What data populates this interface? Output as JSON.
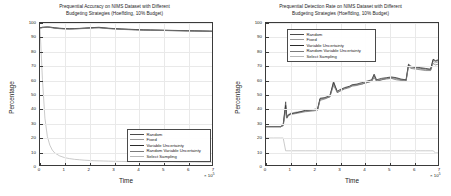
{
  "figure": {
    "width": 451,
    "height": 196,
    "background": "#ffffff"
  },
  "series_colors": {
    "random": "#4a4a4a",
    "fixed": "#9a9a9a",
    "variable_uncertainty": "#2b2b2b",
    "random_variable_uncertainty": "#7a7a7a",
    "select_sampling": "#b8b8b8"
  },
  "legend_labels": {
    "random": "Random",
    "fixed": "Fixed",
    "variable_uncertainty": "Variable Uncertainty",
    "random_variable_uncertainty": "Random Variable Uncertainty",
    "select_sampling": "Select Sampling"
  },
  "axis_common": {
    "xlabel": "Time",
    "ylabel": "Percentage",
    "x_exponent_prefix": "× 10",
    "x_exponent": "5",
    "xticks": [
      "0",
      "1",
      "2",
      "3",
      "4",
      "5",
      "6",
      "7"
    ],
    "yticks": [
      "0",
      "10",
      "20",
      "30",
      "40",
      "50",
      "60",
      "70",
      "80",
      "90",
      "100"
    ]
  },
  "chart_data": [
    {
      "panel": "left",
      "type": "line",
      "title": "Prequential Accuracy on NIMS Dataset with Different\nBudgeting Strategies (Hoeffding, 10% Budget)",
      "xlabel": "Time",
      "ylabel": "Percentage",
      "xlim": [
        0,
        7
      ],
      "ylim": [
        0,
        100
      ],
      "x_multiplier": 100000,
      "grid": true,
      "legend_position": "lower-right",
      "legend": [
        "Random",
        "Fixed",
        "Variable Uncertainty",
        "Random Variable Uncertainty",
        "Select Sampling"
      ],
      "x": [
        0,
        0.1,
        0.2,
        0.3,
        0.4,
        0.5,
        0.6,
        0.8,
        1.0,
        1.2,
        1.4,
        1.6,
        1.8,
        2.0,
        2.2,
        2.4,
        2.6,
        2.8,
        3.0,
        3.3,
        3.6,
        3.9,
        4.2,
        4.5,
        4.8,
        5.1,
        5.4,
        5.7,
        6.0,
        6.3,
        6.6,
        6.9,
        7.1
      ],
      "series": [
        {
          "name": "Random",
          "values": [
            96.5,
            96.9,
            97.0,
            97.1,
            97.0,
            96.8,
            96.5,
            96.2,
            96.0,
            95.9,
            96.0,
            96.1,
            96.3,
            96.5,
            96.7,
            96.8,
            96.5,
            96.2,
            96.0,
            95.7,
            95.5,
            95.3,
            95.1,
            95.0,
            94.9,
            94.8,
            94.7,
            94.6,
            94.5,
            94.4,
            94.3,
            94.2,
            94.1
          ]
        },
        {
          "name": "Fixed",
          "values": [
            96.4,
            96.8,
            96.9,
            97.0,
            96.9,
            96.7,
            96.4,
            96.1,
            95.9,
            95.8,
            95.9,
            96.0,
            96.2,
            96.4,
            96.6,
            96.7,
            96.4,
            96.1,
            95.9,
            95.6,
            95.4,
            95.2,
            95.0,
            94.9,
            94.8,
            94.7,
            94.6,
            94.5,
            94.4,
            94.3,
            94.2,
            94.1,
            94.0
          ]
        },
        {
          "name": "Variable Uncertainty",
          "values": [
            96.6,
            97.0,
            97.1,
            97.2,
            97.1,
            96.9,
            96.6,
            96.3,
            96.1,
            96.0,
            96.1,
            96.2,
            96.4,
            96.6,
            96.8,
            97.0,
            96.6,
            96.3,
            96.1,
            95.8,
            95.6,
            95.4,
            95.2,
            95.1,
            95.0,
            94.9,
            94.8,
            94.7,
            94.6,
            94.5,
            94.4,
            94.3,
            94.2
          ]
        },
        {
          "name": "Random Variable Uncertainty",
          "values": [
            96.3,
            96.7,
            96.9,
            97.0,
            96.9,
            96.6,
            96.3,
            96.0,
            95.8,
            95.7,
            95.8,
            96.0,
            96.1,
            96.3,
            96.5,
            96.6,
            96.3,
            96.0,
            95.8,
            95.5,
            95.3,
            95.1,
            95.0,
            94.9,
            94.8,
            94.7,
            94.6,
            94.5,
            94.4,
            94.3,
            94.2,
            94.1,
            94.0
          ]
        },
        {
          "name": "Select Sampling",
          "values": [
            96.5,
            60.0,
            33.0,
            20.0,
            14.0,
            10.5,
            8.5,
            6.4,
            5.2,
            4.5,
            4.0,
            3.7,
            3.4,
            3.2,
            3.0,
            2.9,
            2.8,
            2.7,
            2.6,
            2.5,
            2.4,
            2.4,
            2.3,
            2.3,
            2.2,
            2.2,
            2.2,
            2.1,
            2.1,
            2.1,
            2.0,
            2.0,
            2.0
          ]
        }
      ]
    },
    {
      "panel": "right",
      "type": "line",
      "title": "Prequential Detection Rate on NIMS Dataset with Different\nBudgeting Strategies (Hoeffding, 10% Budget)",
      "xlabel": "Time",
      "ylabel": "Percentage",
      "xlim": [
        0,
        7
      ],
      "ylim": [
        0,
        100
      ],
      "x_multiplier": 100000,
      "grid": true,
      "legend_position": "upper-left",
      "legend": [
        "Random",
        "Fixed",
        "Variable Uncertainty",
        "Random Variable Uncertainty",
        "Select Sampling"
      ],
      "x": [
        0,
        0.3,
        0.6,
        0.7,
        0.8,
        0.85,
        0.9,
        1.0,
        1.3,
        1.6,
        1.9,
        2.1,
        2.2,
        2.4,
        2.6,
        2.75,
        2.9,
        3.0,
        3.2,
        3.4,
        3.5,
        3.7,
        3.9,
        4.1,
        4.3,
        4.4,
        4.5,
        4.7,
        4.9,
        5.1,
        5.3,
        5.5,
        5.7,
        5.8,
        5.9,
        6.1,
        6.3,
        6.5,
        6.7,
        6.8,
        6.9,
        7.0,
        7.1
      ],
      "series": [
        {
          "name": "Random",
          "values": [
            27.0,
            27.0,
            27.0,
            28.0,
            44.5,
            33.0,
            35.0,
            36.0,
            37.0,
            38.0,
            38.5,
            39.0,
            46.5,
            47.0,
            48.0,
            59.0,
            51.0,
            52.0,
            54.0,
            55.0,
            56.0,
            56.5,
            57.0,
            58.0,
            59.0,
            63.0,
            59.0,
            60.0,
            61.0,
            61.5,
            61.0,
            60.0,
            59.5,
            70.5,
            69.0,
            68.5,
            68.0,
            67.5,
            67.0,
            74.0,
            73.0,
            73.5,
            74.0
          ]
        },
        {
          "name": "Fixed",
          "values": [
            27.0,
            27.0,
            27.0,
            28.0,
            40.0,
            34.0,
            35.5,
            36.5,
            37.5,
            38.0,
            38.5,
            39.5,
            46.0,
            47.0,
            48.5,
            57.0,
            51.5,
            52.5,
            54.0,
            55.0,
            56.0,
            56.5,
            57.5,
            58.5,
            59.5,
            62.0,
            59.5,
            60.5,
            61.0,
            61.0,
            60.5,
            60.0,
            59.0,
            70.0,
            68.5,
            68.0,
            67.5,
            67.0,
            67.0,
            73.0,
            72.0,
            72.5,
            73.0
          ]
        },
        {
          "name": "Variable Uncertainty",
          "values": [
            27.0,
            27.0,
            27.0,
            28.5,
            42.0,
            33.5,
            35.0,
            36.0,
            37.0,
            38.5,
            39.0,
            39.5,
            47.0,
            47.5,
            49.0,
            58.0,
            52.0,
            53.0,
            54.5,
            55.5,
            56.5,
            57.0,
            58.0,
            59.0,
            60.0,
            64.0,
            60.0,
            61.0,
            61.5,
            62.0,
            61.5,
            60.5,
            60.0,
            71.0,
            69.5,
            69.0,
            68.5,
            68.0,
            67.5,
            74.5,
            73.5,
            74.0,
            74.5
          ]
        },
        {
          "name": "Random Variable Uncertainty",
          "values": [
            27.0,
            27.0,
            27.0,
            27.5,
            38.0,
            33.0,
            34.5,
            35.5,
            36.5,
            37.5,
            38.0,
            38.5,
            45.5,
            46.5,
            48.0,
            56.0,
            51.0,
            52.0,
            53.5,
            54.5,
            55.5,
            56.0,
            57.0,
            58.0,
            59.0,
            61.5,
            59.0,
            60.0,
            60.5,
            61.0,
            60.0,
            59.5,
            59.0,
            69.5,
            68.0,
            67.5,
            67.0,
            66.5,
            66.5,
            71.5,
            70.5,
            71.0,
            71.5
          ]
        },
        {
          "name": "Select Sampling",
          "values": [
            19.0,
            19.0,
            19.0,
            19.0,
            10.0,
            10.0,
            10.0,
            10.0,
            10.0,
            10.0,
            10.0,
            10.0,
            10.0,
            10.0,
            10.0,
            10.0,
            10.0,
            10.0,
            10.0,
            10.0,
            10.0,
            10.0,
            10.0,
            10.0,
            10.0,
            10.0,
            10.0,
            10.0,
            10.0,
            10.0,
            10.0,
            10.0,
            10.0,
            10.0,
            10.0,
            10.0,
            10.0,
            10.0,
            10.0,
            10.0,
            8.5,
            8.5,
            8.5
          ]
        }
      ]
    }
  ]
}
